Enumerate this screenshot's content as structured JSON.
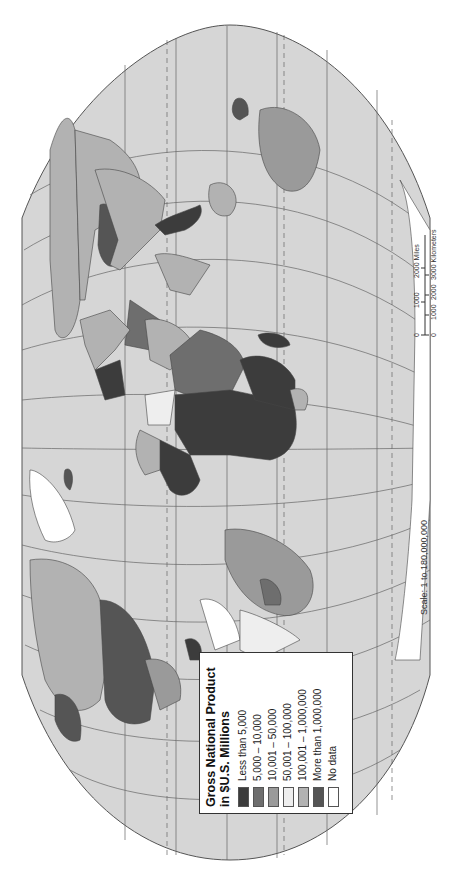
{
  "legend": {
    "title_line1": "Gross National Product",
    "title_line2": "in $U.S. Millions",
    "items": [
      {
        "label": "Less than 5,000",
        "color": "#3c3c3c"
      },
      {
        "label": "5,000 – 10,000",
        "color": "#6e6e6e"
      },
      {
        "label": "10,001 – 50,000",
        "color": "#9a9a9a"
      },
      {
        "label": "50,001 – 100,000",
        "color": "#eeeeee"
      },
      {
        "label": "100,001 – 1,000,000",
        "color": "#b2b2b2"
      },
      {
        "label": "More than 1,000,000",
        "color": "#555555"
      },
      {
        "label": "No data",
        "color": "#ffffff"
      }
    ]
  },
  "scale": {
    "ratio_text": "Scale: 1 to 180,000,000",
    "miles_ticks": [
      "0",
      "1000",
      "2000 Miles"
    ],
    "km_ticks": [
      "0",
      "1000",
      "2000",
      "3000 Kilometers"
    ]
  },
  "colors": {
    "ocean": "#d6d6d6",
    "graticule": "#555555",
    "land_default": "#b2b2b2"
  }
}
